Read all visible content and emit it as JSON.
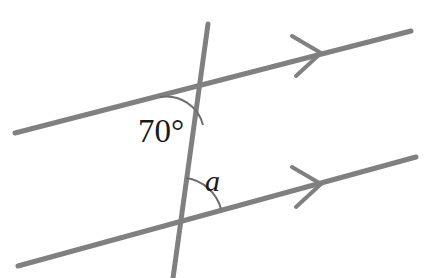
{
  "figure": {
    "background_color": "#ffffff",
    "line_color": "#808080",
    "text_color": "#1a1a1a",
    "arc_color": "#6e6e6e",
    "stroke_width": 5,
    "arc_stroke_width": 2,
    "width": 425,
    "height": 278
  },
  "labels": {
    "known_angle": "70°",
    "unknown_angle": "a"
  },
  "geometry": {
    "upper_parallel_line": {
      "name": "upper-parallel-line",
      "x1": 15,
      "y1": 133,
      "x2": 411,
      "y2": 31,
      "arrow_marks": 1
    },
    "lower_parallel_line": {
      "name": "lower-parallel-line",
      "x1": 18,
      "y1": 266,
      "x2": 416,
      "y2": 157,
      "arrow_marks": 1
    },
    "transversal_line": {
      "name": "transversal-line",
      "x1": 208,
      "y1": 24,
      "x2": 173,
      "y2": 278
    },
    "upper_intersection": {
      "x": 198,
      "y": 87
    },
    "lower_intersection": {
      "x": 180,
      "y": 220
    },
    "upper_arrow_vertex": {
      "x": 321,
      "y": 53
    },
    "lower_arrow_vertex": {
      "x": 321,
      "y": 184
    },
    "known_angle_arc": {
      "center_x": 198,
      "center_y": 87,
      "radius": 38,
      "start_x": 160,
      "start_y": 97,
      "end_x": 203,
      "end_y": 125
    },
    "unknown_angle_arc": {
      "center_x": 180,
      "center_y": 220,
      "radius": 42,
      "start_x": 186,
      "start_y": 178,
      "end_x": 221,
      "end_y": 209
    },
    "known_angle_label_pos": {
      "x": 138,
      "y": 142
    },
    "unknown_angle_label_pos": {
      "x": 205,
      "y": 191
    }
  },
  "chart_data": {
    "type": "diagram",
    "subtype": "euclidean-geometry",
    "elements": [
      {
        "kind": "line",
        "role": "parallel",
        "id": "upper",
        "from": [
          15,
          133
        ],
        "to": [
          411,
          31
        ],
        "marker": "single-chevron"
      },
      {
        "kind": "line",
        "role": "parallel",
        "id": "lower",
        "from": [
          18,
          266
        ],
        "to": [
          416,
          157
        ],
        "marker": "single-chevron"
      },
      {
        "kind": "line",
        "role": "transversal",
        "id": "transversal",
        "from": [
          208,
          24
        ],
        "to": [
          173,
          278
        ],
        "marker": "none"
      },
      {
        "kind": "angle",
        "id": "known",
        "vertex": [
          198,
          87
        ],
        "value": 70,
        "unit": "degrees",
        "label": "70°"
      },
      {
        "kind": "angle",
        "id": "unknown",
        "vertex": [
          180,
          220
        ],
        "value": null,
        "unit": "degrees",
        "label": "a"
      }
    ],
    "annotations": [
      "70°",
      "a"
    ],
    "relationship": "co-interior / alternate angle pair on parallel lines"
  }
}
